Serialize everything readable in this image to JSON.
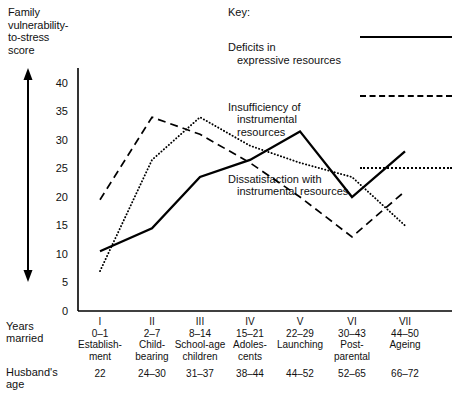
{
  "axis": {
    "y_title": "Family\nvulnerability-\nto-stress\nscore",
    "y_ticks": [
      "40",
      "35",
      "30",
      "25",
      "20",
      "15",
      "10",
      "5",
      "0"
    ],
    "row_label_years": "Years\nmarried",
    "row_label_husband": "Husband's\nage"
  },
  "legend": {
    "title": "Key:",
    "entries": [
      {
        "line1": "Deficits in",
        "line2": "expressive resources",
        "style": "solid"
      },
      {
        "line1": "Insufficiency of",
        "line2": "instrumental\nresources",
        "style": "dashed"
      },
      {
        "line1": "Dissatisfaction with",
        "line2": "instrumental resources",
        "style": "dotted"
      }
    ]
  },
  "chart_data": {
    "type": "line",
    "xlabel": "Years married",
    "ylabel": "Family vulnerability-to-stress score",
    "ylim": [
      0,
      42
    ],
    "yticks": [
      0,
      5,
      10,
      15,
      20,
      25,
      30,
      35,
      40
    ],
    "grid": false,
    "legend_position": "top-right",
    "categories": [
      "I",
      "II",
      "III",
      "IV",
      "V",
      "VI",
      "VII"
    ],
    "category_details": [
      {
        "roman": "I",
        "years": "0–1",
        "stage": "Establish-\nment",
        "husband_age": "22"
      },
      {
        "roman": "II",
        "years": "2–7",
        "stage": "Child-\nbearing",
        "husband_age": "24–30"
      },
      {
        "roman": "III",
        "years": "8–14",
        "stage": "School-age\nchildren",
        "husband_age": "31–37"
      },
      {
        "roman": "IV",
        "years": "15–21",
        "stage": "Adoles-\ncents",
        "husband_age": "38–44"
      },
      {
        "roman": "V",
        "years": "22–29",
        "stage": "Launching",
        "husband_age": "44–52"
      },
      {
        "roman": "VI",
        "years": "30–43",
        "stage": "Post-\nparental",
        "husband_age": "52–65"
      },
      {
        "roman": "VII",
        "years": "44–50",
        "stage": "Ageing",
        "husband_age": "66–72"
      }
    ],
    "series": [
      {
        "name": "Deficits in expressive resources",
        "style": "solid",
        "values": [
          10.5,
          14.5,
          23.5,
          26.5,
          31.5,
          20,
          28
        ]
      },
      {
        "name": "Insufficiency of instrumental resources",
        "style": "dashed",
        "values": [
          19.5,
          34,
          31,
          26,
          20,
          13,
          21
        ]
      },
      {
        "name": "Dissatisfaction with instrumental resources",
        "style": "dotted",
        "values": [
          7,
          26.5,
          34,
          29,
          26,
          23.5,
          15
        ]
      }
    ]
  }
}
